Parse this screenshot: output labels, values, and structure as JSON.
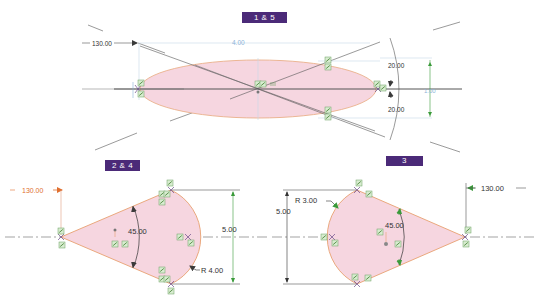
{
  "view_labels": {
    "top": "1 & 5",
    "bottom_left": "2 & 4",
    "bottom_right": "3"
  },
  "top_view": {
    "shape": "ellipse",
    "dimensions": {
      "angle_ref": "130.00",
      "length": "4.00",
      "upper_angle": "20.00",
      "lower_angle": "20.00",
      "height": "1.00"
    }
  },
  "bottom_left_view": {
    "shape": "sector",
    "dimensions": {
      "angle_ref": "130.00",
      "sweep_angle": "45.00",
      "height": "5.00",
      "radius": "R 4.00"
    }
  },
  "bottom_right_view": {
    "shape": "sector",
    "dimensions": {
      "angle_ref": "130.00",
      "sweep_angle": "45.00",
      "height": "5.00",
      "radius": "R 3.00"
    }
  },
  "colors": {
    "fill": "#f6d6e0",
    "outline": "#e8a070",
    "label_bg": "#4b2a78",
    "dim_line": "#3a3a3a",
    "dim_highlight": "#e07030",
    "ref_dim": "#8cb4d8",
    "constraint_green": "#4a9a3a"
  }
}
